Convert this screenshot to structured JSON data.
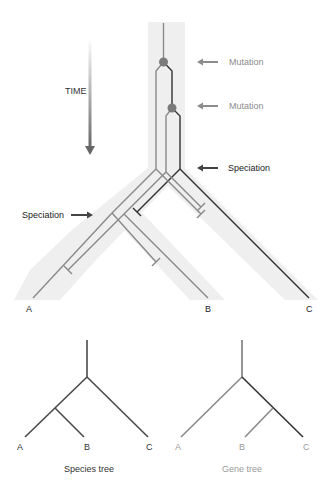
{
  "figure": {
    "time_label": "TIME",
    "annotations": {
      "mutation_1": "Mutation",
      "mutation_2": "Mutation",
      "speciation_right": "Speciation",
      "speciation_left": "Speciation"
    },
    "tips": {
      "a": "A",
      "b": "B",
      "c": "C"
    }
  },
  "species_tree": {
    "title": "Species tree",
    "tips": {
      "a": "A",
      "b": "B",
      "c": "C"
    }
  },
  "gene_tree": {
    "title": "Gene tree",
    "tips": {
      "a": "A",
      "b": "B",
      "c": "C"
    }
  },
  "colors": {
    "band": "#efefef",
    "gray_line": "#8a8a8a",
    "dark_line": "#333333",
    "dot": "#7a7a7a",
    "mutation_text": "#8c8c8c",
    "speciation_text": "#222222",
    "gene_text": "#9a9a9a"
  }
}
